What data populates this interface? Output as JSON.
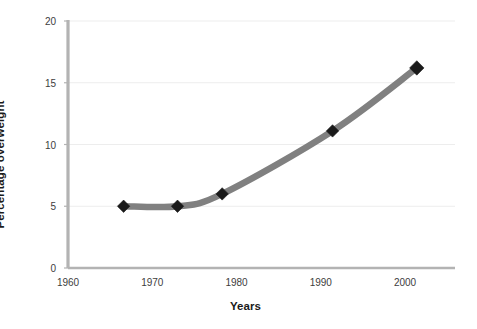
{
  "chart_data": {
    "type": "line",
    "title": "",
    "subtitle": "",
    "xlabel": "Years",
    "ylabel": "Percentage overweight",
    "xlim": [
      1960,
      2005
    ],
    "ylim": [
      0,
      20
    ],
    "x_ticks": [
      1960,
      1970,
      1980,
      1990,
      2000
    ],
    "x_tick_labels": [
      "1960",
      "1970",
      "1980",
      "1990",
      "2000"
    ],
    "y_ticks": [
      0,
      5,
      10,
      15,
      20
    ],
    "y_tick_labels": [
      "0",
      "5",
      "10",
      "15",
      "20"
    ],
    "grid": "horizontal",
    "legend": "none",
    "series": [
      {
        "name": "Percentage overweight",
        "marker": "diamond",
        "line_color": "#808080",
        "marker_color": "#1a1a1a",
        "x": [
          1966.6,
          1973.0,
          1978.3,
          1991.4,
          2001.4
        ],
        "values": [
          5.0,
          5.0,
          6.0,
          11.1,
          16.2
        ],
        "points": [
          {
            "x": 1966.6,
            "y": 5.0
          },
          {
            "x": 1973.0,
            "y": 5.0
          },
          {
            "x": 1978.3,
            "y": 6.0
          },
          {
            "x": 1991.4,
            "y": 11.1
          },
          {
            "x": 2001.4,
            "y": 16.2
          }
        ]
      }
    ],
    "colors": {
      "line": "#808080",
      "marker": "#1a1a1a",
      "axis": "#b3b3b3",
      "grid": "#ededed",
      "text": "#3d3d3d",
      "title_text": "#1a1a1a",
      "background": "#ffffff"
    }
  }
}
